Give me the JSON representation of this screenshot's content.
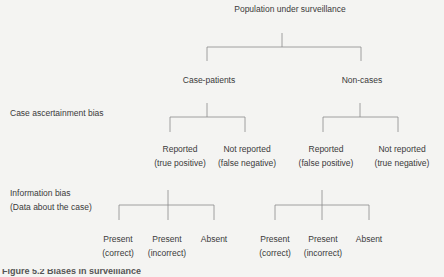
{
  "diagram": {
    "root": "Population under surveillance",
    "level1": {
      "left": "Case-patients",
      "right": "Non-cases"
    },
    "row_labels": {
      "case_ascertainment": "Case ascertainment bias",
      "information_bias_line1": "Information bias",
      "information_bias_line2": "(Data about the case)"
    },
    "level2": [
      {
        "line1": "Reported",
        "line2": "(true positive)"
      },
      {
        "line1": "Not reported",
        "line2": "(false negative)"
      },
      {
        "line1": "Reported",
        "line2": "(false positive)"
      },
      {
        "line1": "Not reported",
        "line2": "(true negative)"
      }
    ],
    "level3_left": [
      {
        "line1": "Present",
        "line2": "(correct)"
      },
      {
        "line1": "Present",
        "line2": "(incorrect)"
      },
      {
        "line1": "Absent",
        "line2": ""
      }
    ],
    "level3_right": [
      {
        "line1": "Present",
        "line2": "(correct)"
      },
      {
        "line1": "Present",
        "line2": "(incorrect)"
      },
      {
        "line1": "Absent",
        "line2": ""
      }
    ],
    "caption": "Figure 5.2 Biases in surveillance"
  },
  "colors": {
    "background": "#f4f4f2",
    "text": "#3a3a3a",
    "lines": "#8a8a8a"
  }
}
